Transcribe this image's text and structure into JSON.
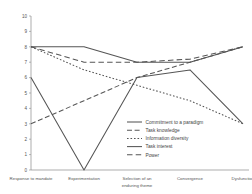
{
  "chart_data": {
    "type": "line",
    "title": "",
    "subtitle": "",
    "xlabel": "",
    "ylabel": "",
    "ylim": [
      0,
      10
    ],
    "grid": false,
    "legend_position": "inside-bottom-right",
    "categories": [
      "Response to mandate",
      "Experimentation",
      "Selection of an enduring theme",
      "Convergence",
      "Dysfunction"
    ],
    "yticks": [
      "0",
      "1",
      "2",
      "3",
      "4",
      "5",
      "6",
      "7",
      "8",
      "9",
      "10"
    ],
    "series": [
      {
        "name": "Commitment to a paradigm",
        "style": "solid",
        "values": [
          8,
          8,
          7,
          7,
          8
        ]
      },
      {
        "name": "Task knowledge",
        "style": "dashed",
        "values": [
          3,
          4.5,
          6,
          7,
          8
        ]
      },
      {
        "name": "Information diversity",
        "style": "dash-dot",
        "values": [
          8,
          6.5,
          5.5,
          4.5,
          3
        ]
      },
      {
        "name": "Task interest",
        "style": "solid",
        "values": [
          6,
          0,
          6,
          6.5,
          3
        ]
      },
      {
        "name": "Power",
        "style": "dashed-long",
        "values": [
          8,
          7,
          7,
          7.2,
          8
        ]
      }
    ]
  },
  "legend": {
    "items": [
      {
        "label": "Commitment to a paradigm",
        "swatch": "solid"
      },
      {
        "label": "Task knowledge",
        "swatch": "dashed"
      },
      {
        "label": "Information diversity",
        "swatch": "dash-dot"
      },
      {
        "label": "Task interest",
        "swatch": "solid"
      },
      {
        "label": "Power",
        "swatch": "dashed-long"
      }
    ]
  },
  "xaxis": {
    "labels": [
      {
        "line1": "Response to mandate",
        "line2": ""
      },
      {
        "line1": "Experimentation",
        "line2": ""
      },
      {
        "line1": "Selection of an",
        "line2": "enduring theme"
      },
      {
        "line1": "Convergence",
        "line2": ""
      },
      {
        "line1": "Dysfunction",
        "line2": ""
      }
    ]
  },
  "colors": {
    "line": "#555555",
    "axis": "#8a8a8a",
    "text": "#555555",
    "background": "#ffffff"
  }
}
